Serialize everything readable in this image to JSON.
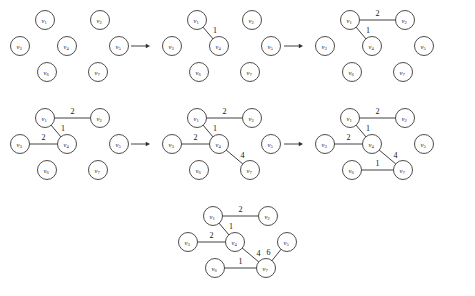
{
  "figure": {
    "node_ids": [
      "v1",
      "v2",
      "v3",
      "v4",
      "v5",
      "v6",
      "v7"
    ],
    "node_labels": {
      "v1": {
        "base": "v",
        "sub": "1"
      },
      "v2": {
        "base": "v",
        "sub": "2"
      },
      "v3": {
        "base": "v",
        "sub": "3"
      },
      "v4": {
        "base": "v",
        "sub": "4"
      },
      "v5": {
        "base": "v",
        "sub": "5"
      },
      "v6": {
        "base": "v",
        "sub": "6"
      },
      "v7": {
        "base": "v",
        "sub": "7"
      }
    },
    "node_radius": 9.5,
    "colors": {
      "node_stroke": "#3a3a3a",
      "node_fill": "#ffffff",
      "edge_stroke": "#2e2e2e",
      "label_fill": "#1a1a1a",
      "weight_fill": "#111111",
      "background": "#ffffff"
    },
    "layout": {
      "node_offsets": {
        "v1": {
          "x": 45,
          "y": 20
        },
        "v2": {
          "x": 100,
          "y": 20
        },
        "v3": {
          "x": 20,
          "y": 46
        },
        "v4": {
          "x": 67,
          "y": 46
        },
        "v5": {
          "x": 119,
          "y": 46
        },
        "v6": {
          "x": 47,
          "y": 72
        },
        "v7": {
          "x": 98,
          "y": 72
        }
      }
    },
    "graphs": [
      {
        "id": "graph-1",
        "step": 1,
        "origin": {
          "x": 0,
          "y": 0
        },
        "edges": []
      },
      {
        "id": "graph-2",
        "step": 2,
        "origin": {
          "x": 152,
          "y": 0
        },
        "edges": [
          {
            "from": "v1",
            "to": "v4",
            "weight": "1",
            "label_offset": {
              "x": 7,
              "y": -3
            }
          }
        ]
      },
      {
        "id": "graph-3",
        "step": 3,
        "origin": {
          "x": 305,
          "y": 0
        },
        "edges": [
          {
            "from": "v1",
            "to": "v4",
            "weight": "1",
            "label_offset": {
              "x": 7,
              "y": -3
            }
          },
          {
            "from": "v1",
            "to": "v2",
            "weight": "2",
            "label_offset": {
              "x": 0,
              "y": -7
            }
          }
        ]
      },
      {
        "id": "graph-4",
        "step": 4,
        "origin": {
          "x": 0,
          "y": 98
        },
        "edges": [
          {
            "from": "v1",
            "to": "v4",
            "weight": "1",
            "label_offset": {
              "x": 7,
              "y": -3
            }
          },
          {
            "from": "v1",
            "to": "v2",
            "weight": "2",
            "label_offset": {
              "x": 0,
              "y": -7
            }
          },
          {
            "from": "v3",
            "to": "v4",
            "weight": "2",
            "label_offset": {
              "x": 0,
              "y": -7
            }
          }
        ]
      },
      {
        "id": "graph-5",
        "step": 5,
        "origin": {
          "x": 152,
          "y": 98
        },
        "edges": [
          {
            "from": "v1",
            "to": "v4",
            "weight": "1",
            "label_offset": {
              "x": 7,
              "y": -3
            }
          },
          {
            "from": "v1",
            "to": "v2",
            "weight": "2",
            "label_offset": {
              "x": 0,
              "y": -7
            }
          },
          {
            "from": "v3",
            "to": "v4",
            "weight": "2",
            "label_offset": {
              "x": 0,
              "y": -7
            }
          },
          {
            "from": "v4",
            "to": "v7",
            "weight": "4",
            "label_offset": {
              "x": 8,
              "y": -2
            }
          }
        ]
      },
      {
        "id": "graph-6",
        "step": 6,
        "origin": {
          "x": 305,
          "y": 98
        },
        "edges": [
          {
            "from": "v1",
            "to": "v4",
            "weight": "1",
            "label_offset": {
              "x": 7,
              "y": -3
            }
          },
          {
            "from": "v1",
            "to": "v2",
            "weight": "2",
            "label_offset": {
              "x": 0,
              "y": -7
            }
          },
          {
            "from": "v3",
            "to": "v4",
            "weight": "2",
            "label_offset": {
              "x": 0,
              "y": -7
            }
          },
          {
            "from": "v4",
            "to": "v7",
            "weight": "4",
            "label_offset": {
              "x": 8,
              "y": -2
            }
          },
          {
            "from": "v6",
            "to": "v7",
            "weight": "1",
            "label_offset": {
              "x": 0,
              "y": -7
            }
          }
        ]
      },
      {
        "id": "graph-7",
        "step": 7,
        "origin": {
          "x": 168,
          "y": 196
        },
        "edges": [
          {
            "from": "v1",
            "to": "v4",
            "weight": "1",
            "label_offset": {
              "x": 7,
              "y": -3
            }
          },
          {
            "from": "v1",
            "to": "v2",
            "weight": "2",
            "label_offset": {
              "x": 0,
              "y": -7
            }
          },
          {
            "from": "v3",
            "to": "v4",
            "weight": "2",
            "label_offset": {
              "x": 0,
              "y": -7
            }
          },
          {
            "from": "v4",
            "to": "v7",
            "weight": "4",
            "label_offset": {
              "x": 8,
              "y": -2
            }
          },
          {
            "from": "v6",
            "to": "v7",
            "weight": "1",
            "label_offset": {
              "x": 0,
              "y": -7
            }
          },
          {
            "from": "v7",
            "to": "v5",
            "weight": "6",
            "label_offset": {
              "x": -8,
              "y": -3
            }
          }
        ]
      }
    ],
    "arrows": [
      {
        "id": "arrow-1",
        "from": {
          "x": 131,
          "y": 46
        },
        "to": {
          "x": 150,
          "y": 46
        }
      },
      {
        "id": "arrow-2",
        "from": {
          "x": 284,
          "y": 46
        },
        "to": {
          "x": 303,
          "y": 46
        }
      },
      {
        "id": "arrow-3",
        "from": {
          "x": 131,
          "y": 144
        },
        "to": {
          "x": 150,
          "y": 144
        }
      },
      {
        "id": "arrow-4",
        "from": {
          "x": 284,
          "y": 144
        },
        "to": {
          "x": 303,
          "y": 144
        }
      }
    ]
  }
}
